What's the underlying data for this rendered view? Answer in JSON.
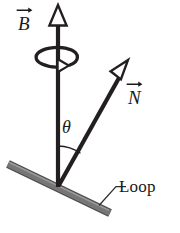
{
  "figure": {
    "background_color": "#ffffff",
    "width": 180,
    "height": 233,
    "labels": {
      "b_vector": "B",
      "n_vector": "N",
      "angle": "θ",
      "loop": "Loop"
    },
    "colors": {
      "vector_stroke": "#231f20",
      "vector_fill": "#ffffff",
      "loop_bar": "#6e6e6e",
      "loop_bar_edge": "#4a4a4a",
      "leader_line": "#3a3a3a",
      "text": "#1a1a1a",
      "rotation_arc": "#231f20"
    },
    "geometry": {
      "origin": {
        "x": 58,
        "y": 186
      },
      "b_arrow": {
        "x1": 58,
        "y1": 186,
        "x2": 58,
        "y2": 6,
        "label": "B"
      },
      "n_arrow": {
        "x1": 58,
        "y1": 186,
        "x2": 128,
        "y2": 61,
        "label": "N"
      },
      "angle_arc_degrees": 29,
      "loop_bar": {
        "x1": 8,
        "y1": 164,
        "x2": 110,
        "y2": 213
      },
      "leader_line": {
        "x1": 99,
        "y1": 205,
        "x2": 117,
        "y2": 186
      },
      "rotation_ellipse": {
        "cx": 50,
        "cy": 57,
        "rx": 21,
        "ry": 10
      }
    },
    "icon_names": {
      "b_arrowhead": "up-arrowhead-icon",
      "n_arrowhead": "diagonal-arrowhead-icon",
      "rotation": "rotation-arrow-icon",
      "vector_accent": "vector-arrow-accent-icon"
    }
  }
}
